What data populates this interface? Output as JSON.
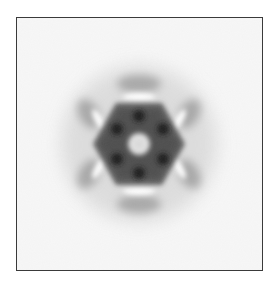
{
  "figure": {
    "type": "2D class average (micrograph)",
    "symmetry": "6-fold",
    "colors": {
      "background": "#f7f7f7",
      "frame_border": "#3a3a3a",
      "density_dark": "#2a2a2a",
      "density_mid": "#6a6a6a",
      "halo": "#b8b8b8",
      "center_light": "#e4e4e4"
    }
  }
}
